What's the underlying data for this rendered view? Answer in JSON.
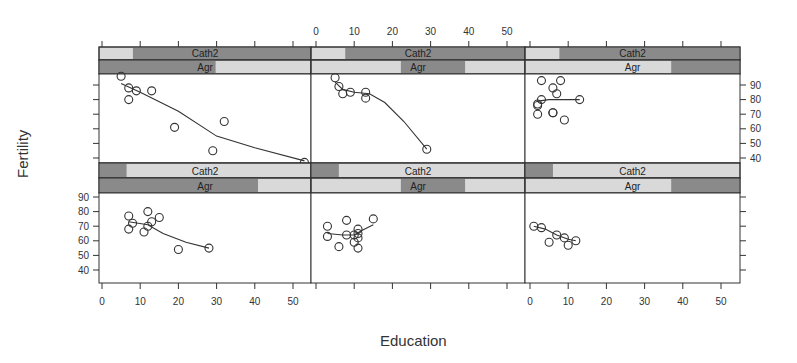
{
  "chart_data": {
    "type": "scatter",
    "subtype": "lattice conditioning plot (coplot) with loess smoothers",
    "xlabel": "Education",
    "ylabel": "Fertility",
    "xlim": [
      0,
      55
    ],
    "ylim": [
      35,
      97
    ],
    "x_ticks": [
      0,
      10,
      20,
      30,
      40,
      50
    ],
    "y_ticks": [
      40,
      50,
      60,
      70,
      80,
      90
    ],
    "conditioning_variables": [
      "Cath2",
      "Agr"
    ],
    "layout": {
      "columns": 3,
      "rows": 2
    },
    "panels": [
      {
        "row": "top",
        "col": 1,
        "strips": {
          "Cath2": {
            "label": "Cath2",
            "shaded_range_frac": [
              0.16,
              1.0
            ]
          },
          "Agr": {
            "label": "Agr",
            "shaded_range_frac": [
              0.0,
              0.55
            ]
          }
        },
        "points": [
          [
            5,
            96
          ],
          [
            7,
            88
          ],
          [
            9,
            86
          ],
          [
            13,
            86
          ],
          [
            7,
            80
          ],
          [
            19,
            61
          ],
          [
            32,
            65
          ],
          [
            29,
            45
          ],
          [
            53,
            37
          ]
        ],
        "smoother": [
          [
            5,
            91
          ],
          [
            10,
            85
          ],
          [
            20,
            72
          ],
          [
            30,
            55
          ],
          [
            40,
            47
          ],
          [
            53,
            38
          ]
        ]
      },
      {
        "row": "top",
        "col": 2,
        "strips": {
          "Cath2": {
            "label": "Cath2",
            "shaded_range_frac": [
              0.16,
              1.0
            ]
          },
          "Agr": {
            "label": "Agr",
            "shaded_range_frac": [
              0.42,
              0.72
            ]
          }
        },
        "points": [
          [
            5,
            95
          ],
          [
            6,
            89
          ],
          [
            7,
            84
          ],
          [
            9,
            85
          ],
          [
            13,
            85
          ],
          [
            13,
            81
          ],
          [
            29,
            46
          ]
        ],
        "smoother": [
          [
            5,
            92
          ],
          [
            7,
            87
          ],
          [
            10,
            85
          ],
          [
            14,
            84
          ],
          [
            18,
            78
          ],
          [
            23,
            65
          ],
          [
            29,
            46
          ]
        ]
      },
      {
        "row": "top",
        "col": 3,
        "strips": {
          "Cath2": {
            "label": "Cath2",
            "shaded_range_frac": [
              0.16,
              1.0
            ]
          },
          "Agr": {
            "label": "Agr",
            "shaded_range_frac": [
              0.68,
              1.0
            ]
          }
        },
        "points": [
          [
            3,
            93
          ],
          [
            8,
            93
          ],
          [
            6,
            88
          ],
          [
            7,
            84
          ],
          [
            3,
            80
          ],
          [
            2,
            77
          ],
          [
            2,
            76
          ],
          [
            2,
            70
          ],
          [
            6,
            71
          ],
          [
            6,
            71
          ],
          [
            9,
            66
          ],
          [
            13,
            80
          ]
        ],
        "smoother": [
          [
            2,
            79
          ],
          [
            5,
            80
          ],
          [
            9,
            80
          ],
          [
            13,
            80
          ]
        ]
      },
      {
        "row": "bottom",
        "col": 1,
        "strips": {
          "Cath2": {
            "label": "Cath2",
            "shaded_range_frac": [
              0.0,
              0.13
            ]
          },
          "Agr": {
            "label": "Agr",
            "shaded_range_frac": [
              0.0,
              0.75
            ]
          }
        },
        "points": [
          [
            7,
            77
          ],
          [
            8,
            72
          ],
          [
            7,
            68
          ],
          [
            12,
            80
          ],
          [
            13,
            73
          ],
          [
            12,
            70
          ],
          [
            11,
            66
          ],
          [
            15,
            76
          ],
          [
            20,
            54
          ],
          [
            28,
            55
          ]
        ],
        "smoother": [
          [
            7,
            73
          ],
          [
            12,
            71
          ],
          [
            16,
            65
          ],
          [
            22,
            59
          ],
          [
            28,
            55
          ]
        ]
      },
      {
        "row": "bottom",
        "col": 2,
        "strips": {
          "Cath2": {
            "label": "Cath2",
            "shaded_range_frac": [
              0.0,
              0.13
            ]
          },
          "Agr": {
            "label": "Agr",
            "shaded_range_frac": [
              0.42,
              0.72
            ]
          }
        },
        "points": [
          [
            3,
            70
          ],
          [
            3,
            63
          ],
          [
            8,
            74
          ],
          [
            8,
            64
          ],
          [
            6,
            56
          ],
          [
            10,
            64
          ],
          [
            10,
            59
          ],
          [
            11,
            68
          ],
          [
            11,
            65
          ],
          [
            11,
            62
          ],
          [
            11,
            55
          ],
          [
            15,
            75
          ]
        ],
        "smoother": [
          [
            3,
            65
          ],
          [
            7,
            64
          ],
          [
            10,
            64
          ],
          [
            12,
            67
          ],
          [
            15,
            71
          ]
        ]
      },
      {
        "row": "bottom",
        "col": 3,
        "strips": {
          "Cath2": {
            "label": "Cath2",
            "shaded_range_frac": [
              0.0,
              0.13
            ]
          },
          "Agr": {
            "label": "Agr",
            "shaded_range_frac": [
              0.68,
              1.0
            ]
          }
        },
        "points": [
          [
            1,
            70
          ],
          [
            3,
            69
          ],
          [
            5,
            59
          ],
          [
            7,
            64
          ],
          [
            9,
            62
          ],
          [
            10,
            57
          ],
          [
            12,
            60
          ]
        ],
        "smoother": [
          [
            1,
            70
          ],
          [
            4,
            68
          ],
          [
            7,
            64
          ],
          [
            10,
            61
          ],
          [
            12,
            60
          ]
        ]
      }
    ],
    "colors": {
      "strip_dark": "#8a8a8a",
      "strip_light": "#d9d9d9",
      "points": "#333333",
      "line": "#333333",
      "frame": "#333333"
    }
  },
  "labels": {
    "x_axis_title": "Education",
    "y_axis_title": "Fertility",
    "strip_cath2": "Cath2",
    "strip_agr": "Agr",
    "x_ticks": [
      "0",
      "10",
      "20",
      "30",
      "40",
      "50"
    ],
    "y_ticks": [
      "90",
      "80",
      "70",
      "60",
      "50",
      "40"
    ]
  }
}
